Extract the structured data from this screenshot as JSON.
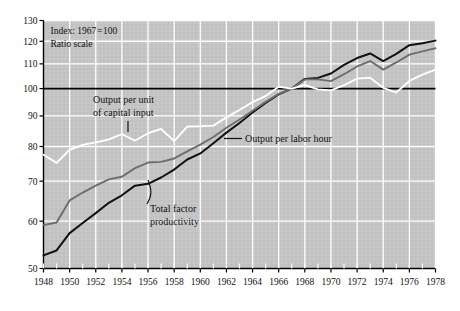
{
  "chart_data": {
    "type": "line",
    "title": "",
    "subtitle": "",
    "notes": [
      "Index: 1967 = 100",
      "Ratio scale"
    ],
    "xlabel": "",
    "ylabel": "",
    "yscale": "log",
    "ylim": [
      50,
      130
    ],
    "ytick_labels": [
      "50",
      "60",
      "70",
      "80",
      "90",
      "100",
      "110",
      "120",
      "130"
    ],
    "yticks": [
      50,
      60,
      70,
      80,
      90,
      100,
      110,
      120,
      130
    ],
    "xlim": [
      1948,
      1978
    ],
    "xticks": [
      1948,
      1950,
      1952,
      1954,
      1956,
      1958,
      1960,
      1962,
      1964,
      1966,
      1968,
      1970,
      1972,
      1974,
      1976,
      1978
    ],
    "xtick_labels": [
      "1948",
      "1950",
      "1952",
      "1954",
      "1956",
      "1958",
      "1960",
      "1962",
      "1964",
      "1966",
      "1968",
      "1970",
      "1972",
      "1974",
      "1976",
      "1978"
    ],
    "minor_xticks_every": 1,
    "grid": true,
    "grid_color": "#ffffff",
    "plot_background": "#c4c4c4",
    "reference_line": {
      "value": 100,
      "color": "#000000"
    },
    "legend": "inline-annotations",
    "x": [
      1948,
      1949,
      1950,
      1951,
      1952,
      1953,
      1954,
      1955,
      1956,
      1957,
      1958,
      1959,
      1960,
      1961,
      1962,
      1963,
      1964,
      1965,
      1966,
      1967,
      1968,
      1969,
      1970,
      1971,
      1972,
      1973,
      1974,
      1975,
      1976,
      1977,
      1978
    ],
    "series": [
      {
        "name": "Output per labor hour",
        "color": "#111111",
        "values": [
          52.6,
          53.6,
          57.3,
          59.6,
          61.9,
          64.4,
          66.3,
          68.8,
          69.3,
          71.0,
          73.2,
          76.1,
          77.9,
          81.0,
          84.4,
          87.6,
          91.2,
          94.6,
          97.8,
          100.0,
          103.8,
          104.2,
          106.0,
          109.6,
          112.5,
          114.5,
          111.2,
          114.3,
          118.2,
          119.1,
          120.3
        ]
      },
      {
        "name": "Total factor productivity",
        "color": "#6e6e6e",
        "values": [
          59.1,
          59.7,
          65.0,
          67.0,
          68.8,
          70.5,
          71.2,
          73.6,
          75.2,
          75.4,
          76.4,
          78.5,
          80.6,
          83.0,
          86.0,
          88.8,
          91.8,
          95.0,
          98.0,
          100.0,
          103.6,
          103.6,
          102.9,
          105.7,
          108.9,
          111.2,
          107.6,
          110.6,
          114.0,
          115.4,
          116.8
        ]
      },
      {
        "name": "Output per unit of capital input",
        "color": "#ffffff",
        "values": [
          77.5,
          75.1,
          79.0,
          80.5,
          81.3,
          82.2,
          83.9,
          81.8,
          84.2,
          85.6,
          81.7,
          86.4,
          86.5,
          86.7,
          89.5,
          92.1,
          94.9,
          97.2,
          100.7,
          100.0,
          101.4,
          99.7,
          99.3,
          101.3,
          103.9,
          104.3,
          100.3,
          98.5,
          103.0,
          105.5,
          107.6
        ]
      }
    ],
    "annotations": [
      {
        "name": "output-per-capital-label",
        "text_lines": [
          "Output per unit",
          "of capital input"
        ]
      },
      {
        "name": "output-per-labor-hour-label",
        "text_lines": [
          "Output per labor hour"
        ]
      },
      {
        "name": "total-factor-productivity-label",
        "text_lines": [
          "Total factor",
          "productivity"
        ]
      }
    ]
  }
}
